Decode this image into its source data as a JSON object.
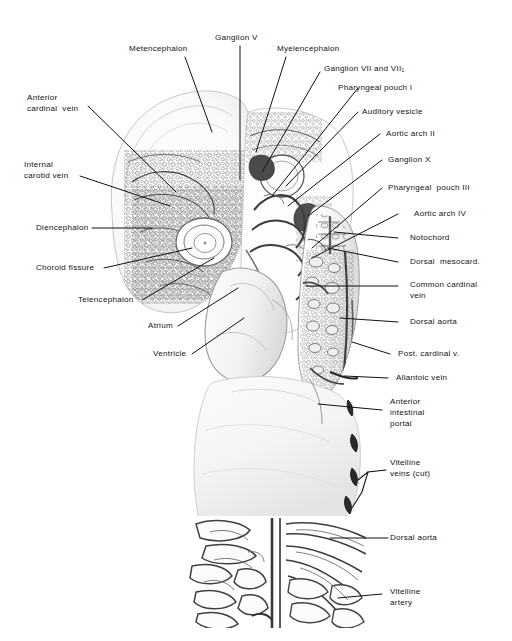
{
  "figure": {
    "background_color": "#ffffff",
    "ink_color": "#222222",
    "label_color": "#131313"
  },
  "labels": {
    "metencephalon": "Metencephalon",
    "ganglion_v": "Ganglion V",
    "myelencephalon": "Myelencephalon",
    "ganglion_vii_viii": "Ganglion VII and VII₁",
    "pharyngeal_pouch_i": "Pharyngeal pouch I",
    "auditory_vesicle": "Auditory vesicle",
    "aortic_arch_ii": "Aortic arch II",
    "ganglion_x": "Ganglion X",
    "pharyngeal_pouch_iii": "Pharyngeal  pouch III",
    "aortic_arch_iv": "Aortic arch IV",
    "notochord": "Notochord",
    "dorsal_mesocard": "Dorsal  mesocard.",
    "common_cardinal_vein_1": "Common cardinal",
    "common_cardinal_vein_2": "vein",
    "dorsal_aorta_upper": "Dorsal aorta",
    "post_cardinal_v": "Post. cardinal v.",
    "allantoic_vein": "Allantoic vein",
    "anterior_intestinal_portal_1": "Anterior",
    "anterior_intestinal_portal_2": "intestinal",
    "anterior_intestinal_portal_3": "portal",
    "vitelline_veins_cut_1": "Vitelline",
    "vitelline_veins_cut_2": "veins (cut)",
    "dorsal_aorta_lower": "Dorsal aorta",
    "vitelline_artery_1": "Vitelline",
    "vitelline_artery_2": "artery",
    "anterior_cardinal_vein_1": "Anterior",
    "anterior_cardinal_vein_2": "cardinal  vein",
    "internal_carotid_vein_1": "Internal",
    "internal_carotid_vein_2": "carotid vein",
    "diencephalon": "Diencephalon",
    "choroid_fissure": "Choroid fissure",
    "telencephalon": "Telencephalon",
    "atrium": "Atrium",
    "ventricle": "Ventricle"
  }
}
